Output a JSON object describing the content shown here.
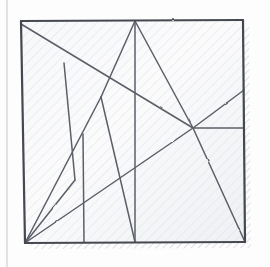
{
  "document": {
    "title": "Hand-drawn square with internal line segments",
    "medium": "pencil sketch on paper",
    "canvas": {
      "width": 270,
      "height": 267
    }
  },
  "paper": {
    "background_color": "#fdfdfd",
    "margin_rule": {
      "name": "notebook-margin-line",
      "orientation": "vertical",
      "x": 7,
      "y1": 0,
      "y2": 267,
      "color": "#c8cdd6",
      "width": 1.1
    }
  },
  "figure": {
    "name": "square-outline",
    "stroke_color": "#4a4d55",
    "stroke_width": 2.2,
    "fill_color": "#f4f5f7",
    "corners": {
      "top_left": [
        21,
        21
      ],
      "top_right": [
        243,
        20
      ],
      "bottom_right": [
        245,
        242
      ],
      "bottom_left": [
        25,
        243
      ]
    },
    "shadow": {
      "name": "drop-shadow-hatch",
      "color": "#d3d6dc",
      "offset_x": 6,
      "offset_y": 6
    },
    "shading": {
      "name": "pencil-hatching",
      "angle_deg": 45,
      "color": "#d8dbe1",
      "spacing": 7
    }
  },
  "chart_data": {
    "type": "line",
    "title": "Hand-drawn square with internal line segments",
    "xlabel": "",
    "ylabel": "",
    "xlim": [
      0,
      270
    ],
    "ylim": [
      267,
      0
    ],
    "grid": false,
    "legend": "none",
    "annotations": [],
    "nodes": [
      {
        "id": "TL",
        "label": "top-left-corner",
        "x": 21,
        "y": 21
      },
      {
        "id": "TR",
        "label": "top-right-corner",
        "x": 243,
        "y": 20
      },
      {
        "id": "BR",
        "label": "bottom-right-corner",
        "x": 245,
        "y": 242
      },
      {
        "id": "BL",
        "label": "bottom-left-corner",
        "x": 25,
        "y": 243
      },
      {
        "id": "TA",
        "label": "top-apex",
        "x": 135,
        "y": 21
      },
      {
        "id": "VL",
        "label": "left-vee-vertex",
        "x": 101,
        "y": 97
      },
      {
        "id": "JN",
        "label": "right-junction-node",
        "x": 193,
        "y": 128
      },
      {
        "id": "LK",
        "label": "left-kink-vertex",
        "x": 64,
        "y": 63
      },
      {
        "id": "SB",
        "label": "short-bar-top",
        "x": 83,
        "y": 134
      },
      {
        "id": "SBB",
        "label": "short-bar-bottom",
        "x": 84,
        "y": 242
      },
      {
        "id": "BM",
        "label": "bottom-mid-vertex",
        "x": 135,
        "y": 242
      },
      {
        "id": "RE1",
        "label": "right-edge-upper",
        "x": 244,
        "y": 90
      },
      {
        "id": "RE2",
        "label": "right-edge-mid",
        "x": 244,
        "y": 128
      }
    ],
    "series": [
      {
        "name": "square-border",
        "values": [
          {
            "name": "top-edge",
            "from": "TL",
            "to": "TR",
            "x1": 21,
            "y1": 21,
            "x2": 243,
            "y2": 20
          },
          {
            "name": "right-edge",
            "from": "TR",
            "to": "BR",
            "x1": 243,
            "y1": 20,
            "x2": 245,
            "y2": 242
          },
          {
            "name": "bottom-edge",
            "from": "BR",
            "to": "BL",
            "x1": 245,
            "y1": 242,
            "x2": 25,
            "y2": 243
          },
          {
            "name": "left-edge",
            "from": "BL",
            "to": "TL",
            "x1": 25,
            "y1": 243,
            "x2": 21,
            "y2": 21
          }
        ]
      },
      {
        "name": "internal-segments",
        "values": [
          {
            "name": "long-diagonal-tl-to-jn",
            "x1": 21,
            "y1": 24,
            "x2": 193,
            "y2": 128
          },
          {
            "name": "apex-left-leg",
            "x1": 135,
            "y1": 21,
            "x2": 101,
            "y2": 97
          },
          {
            "name": "vee-right-leg",
            "x1": 101,
            "y1": 97,
            "x2": 135,
            "y2": 242
          },
          {
            "name": "apex-vertical",
            "x1": 135,
            "y1": 21,
            "x2": 135,
            "y2": 242
          },
          {
            "name": "apex-right-leg",
            "x1": 135,
            "y1": 21,
            "x2": 193,
            "y2": 128
          },
          {
            "name": "jn-to-right-edge-upper",
            "x1": 193,
            "y1": 128,
            "x2": 244,
            "y2": 90
          },
          {
            "name": "jn-to-right-edge-mid",
            "x1": 193,
            "y1": 128,
            "x2": 244,
            "y2": 128
          },
          {
            "name": "jn-to-bottom-right",
            "x1": 193,
            "y1": 128,
            "x2": 245,
            "y2": 242
          },
          {
            "name": "jn-to-bottom-left",
            "x1": 193,
            "y1": 128,
            "x2": 25,
            "y2": 243
          },
          {
            "name": "left-kink-upper",
            "x1": 64,
            "y1": 63,
            "x2": 75,
            "y2": 180
          },
          {
            "name": "left-kink-lower",
            "x1": 75,
            "y1": 180,
            "x2": 25,
            "y2": 243
          },
          {
            "name": "short-vertical-bar",
            "x1": 83,
            "y1": 134,
            "x2": 84,
            "y2": 242
          },
          {
            "name": "bl-to-apex-ray",
            "x1": 25,
            "y1": 243,
            "x2": 101,
            "y2": 97
          }
        ]
      }
    ]
  }
}
